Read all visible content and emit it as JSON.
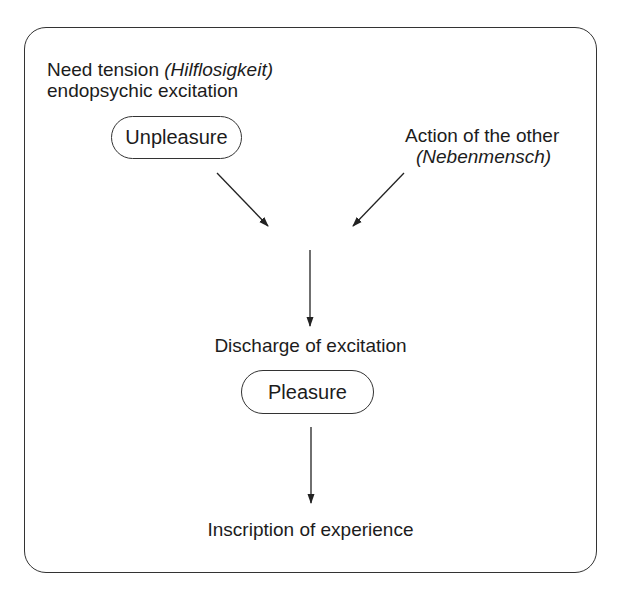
{
  "diagram": {
    "top_left": {
      "line1_plain": "Need tension ",
      "line1_italic": "(Hilflosigkeit)",
      "line2": "endopsychic excitation",
      "node": "Unpleasure"
    },
    "top_right": {
      "line1": "Action of the other",
      "line2_italic": "(Nebenmensch)"
    },
    "middle": {
      "label": "Discharge of excitation",
      "node": "Pleasure"
    },
    "bottom": {
      "label": "Inscription of experience"
    },
    "edges": [
      {
        "from": "Unpleasure",
        "to": "convergence"
      },
      {
        "from": "Action of the other",
        "to": "convergence"
      },
      {
        "from": "convergence",
        "to": "Discharge of excitation"
      },
      {
        "from": "Pleasure",
        "to": "Inscription of experience"
      }
    ]
  }
}
